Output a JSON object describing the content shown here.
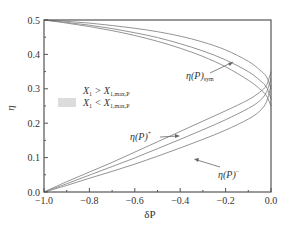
{
  "chart_data": {
    "type": "line",
    "title": "",
    "xlabel": "δP",
    "ylabel": "η",
    "xlim": [
      -1.0,
      0.0
    ],
    "ylim": [
      0.0,
      0.5
    ],
    "grid": false,
    "xticks": [
      -1.0,
      -0.8,
      -0.6,
      -0.4,
      -0.2,
      0.0
    ],
    "xtick_labels": [
      "−1.0",
      "−0.8",
      "−0.6",
      "−0.4",
      "−0.2",
      "0.0"
    ],
    "yticks": [
      0.0,
      0.1,
      0.2,
      0.3,
      0.4,
      0.5
    ],
    "ytick_labels": [
      "0.0",
      "0.1",
      "0.2",
      "0.3",
      "0.4",
      "0.5"
    ],
    "legend": {
      "position": "upper-left-middle",
      "entries": [
        {
          "label": "X₁ > X₁,max,P",
          "swatch": "#ffffff"
        },
        {
          "label": "X₁ < X₁,max,P",
          "swatch": "#dcdcdc"
        }
      ]
    },
    "annotations": [
      {
        "text": "η(P)sym",
        "main": "η(P)",
        "sub": "sym",
        "x": -0.3,
        "y": 0.37
      },
      {
        "text": "η(P)+",
        "main": "η(P)",
        "sup": "+",
        "x": -0.62,
        "y": 0.17
      },
      {
        "text": "η(P)−",
        "main": "η(P)",
        "sup": "−",
        "x": -0.18,
        "y": 0.135
      }
    ],
    "x": [
      -1.0,
      -0.9,
      -0.8,
      -0.7,
      -0.6,
      -0.5,
      -0.4,
      -0.3,
      -0.2,
      -0.1,
      -0.05,
      -0.02,
      0.0
    ],
    "series": [
      {
        "name": "upper-1",
        "values": [
          0.5,
          0.496,
          0.491,
          0.484,
          0.476,
          0.466,
          0.453,
          0.436,
          0.413,
          0.38,
          0.355,
          0.335,
          0.3
        ]
      },
      {
        "name": "upper-2",
        "values": [
          0.5,
          0.493,
          0.485,
          0.475,
          0.463,
          0.449,
          0.431,
          0.41,
          0.384,
          0.35,
          0.325,
          0.305,
          0.27
        ]
      },
      {
        "name": "upper-3",
        "values": [
          0.5,
          0.491,
          0.481,
          0.469,
          0.455,
          0.438,
          0.418,
          0.394,
          0.364,
          0.325,
          0.3,
          0.28,
          0.25
        ]
      },
      {
        "name": "lower-1",
        "values": [
          0.0,
          0.03,
          0.058,
          0.086,
          0.116,
          0.146,
          0.176,
          0.206,
          0.236,
          0.268,
          0.29,
          0.31,
          0.35
        ]
      },
      {
        "name": "lower-2",
        "values": [
          0.0,
          0.024,
          0.049,
          0.074,
          0.099,
          0.126,
          0.153,
          0.181,
          0.21,
          0.243,
          0.265,
          0.29,
          0.33
        ]
      },
      {
        "name": "lower-3",
        "values": [
          0.0,
          0.019,
          0.04,
          0.06,
          0.081,
          0.104,
          0.128,
          0.153,
          0.18,
          0.212,
          0.235,
          0.262,
          0.31
        ]
      }
    ],
    "line_color": "#888888",
    "axis_color": "#555555"
  }
}
